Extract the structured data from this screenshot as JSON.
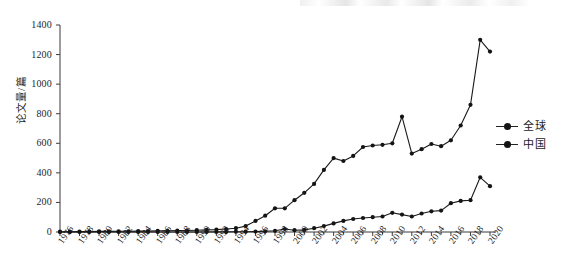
{
  "chart_data": {
    "type": "line",
    "title": "",
    "xlabel": "",
    "ylabel": "论文量/篇",
    "ylim": [
      0,
      1400
    ],
    "ytick_step": 200,
    "ytick_labels": [
      "1400",
      "1200",
      "1000",
      "800",
      "600",
      "400",
      "200",
      "0"
    ],
    "ytick_values": [
      1400,
      1200,
      1000,
      800,
      600,
      400,
      200,
      0
    ],
    "xlim": [
      1976,
      2020
    ],
    "xtick_labels": [
      "1976",
      "1978",
      "1980",
      "1982",
      "1984",
      "1986",
      "1988",
      "1990",
      "1992",
      "1994",
      "1996",
      "1998",
      "2000",
      "2002",
      "2004",
      "2006",
      "2008",
      "2010",
      "2012",
      "2014",
      "2016",
      "2018",
      "2020"
    ],
    "xtick_step": 2,
    "minor_tick_step": 1,
    "grid": false,
    "legend_position": "right",
    "marker": "filled-circle",
    "line_color": "#1a1a1a",
    "x": [
      1976,
      1977,
      1978,
      1979,
      1980,
      1981,
      1982,
      1983,
      1984,
      1985,
      1986,
      1987,
      1988,
      1989,
      1990,
      1991,
      1992,
      1993,
      1994,
      1995,
      1996,
      1997,
      1998,
      1999,
      2000,
      2001,
      2002,
      2003,
      2004,
      2005,
      2006,
      2007,
      2008,
      2009,
      2010,
      2011,
      2012,
      2013,
      2014,
      2015,
      2016,
      2017,
      2018,
      2019,
      2020
    ],
    "series": [
      {
        "name": "全球",
        "values": [
          2,
          2,
          3,
          3,
          4,
          4,
          5,
          5,
          6,
          6,
          8,
          8,
          10,
          10,
          12,
          14,
          16,
          20,
          26,
          40,
          75,
          110,
          160,
          160,
          215,
          265,
          325,
          420,
          500,
          480,
          515,
          575,
          585,
          590,
          600,
          780,
          530,
          560,
          595,
          580,
          620,
          720,
          860,
          1000,
          1300
        ]
      },
      {
        "name": "中国",
        "values": [
          0,
          0,
          0,
          0,
          0,
          0,
          0,
          0,
          0,
          0,
          0,
          0,
          0,
          0,
          0,
          0,
          1,
          1,
          2,
          2,
          3,
          5,
          8,
          20,
          12,
          14,
          26,
          40,
          58,
          75,
          88,
          95,
          100,
          105,
          130,
          118,
          105,
          125,
          140,
          145,
          195,
          210,
          215,
          240,
          270
        ]
      }
    ],
    "series_tail": {
      "note": "final two x positions carry the drop after the peak",
      "全球_final": [
        1300,
        1220
      ],
      "中国_final": [
        370,
        310
      ]
    }
  },
  "legend": {
    "items": [
      {
        "label": "全球",
        "marker": "filled-circle"
      },
      {
        "label": "中国",
        "marker": "filled-circle"
      }
    ]
  },
  "axes": {
    "y_title": "论文量/篇"
  }
}
